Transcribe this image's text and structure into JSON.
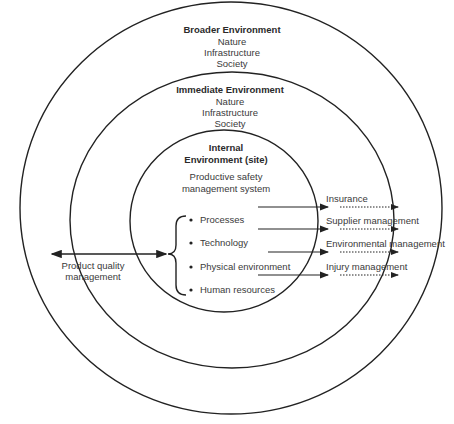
{
  "diagram": {
    "type": "concentric-circles",
    "stroke_color": "#222222",
    "rings": [
      {
        "name": "broader",
        "title": "Broader Environment",
        "items": [
          "Nature",
          "Infrastructure",
          "Society"
        ]
      },
      {
        "name": "immediate",
        "title": "Immediate Environment",
        "items": [
          "Nature",
          "Infrastructure",
          "Society"
        ]
      },
      {
        "name": "internal",
        "title_line1": "Internal",
        "title_line2": "Environment (site)",
        "subtitle_line1": "Productive safety",
        "subtitle_line2": "management system"
      }
    ],
    "bullets": [
      "Processes",
      "Technology",
      "Physical environment",
      "Human resources"
    ],
    "left_label_line1": "Product quality",
    "left_label_line2": "management",
    "outputs": [
      "Insurance",
      "Supplier management",
      "Environmental management",
      "Injury management"
    ]
  }
}
